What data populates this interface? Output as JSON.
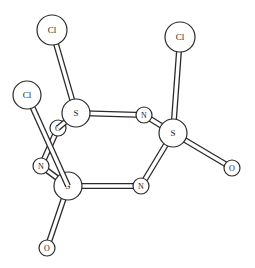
{
  "figure": {
    "type": "ball-and-stick molecular structure",
    "atoms": [
      {
        "id": "cl1",
        "label": "Cl",
        "x": 52,
        "y": 30,
        "r": 15
      },
      {
        "id": "cl2",
        "label": "Cl",
        "x": 180,
        "y": 37,
        "r": 15
      },
      {
        "id": "cl3",
        "label": "Cl",
        "x": 27,
        "y": 95,
        "r": 14
      },
      {
        "id": "o1",
        "label": "O",
        "x": 58,
        "y": 128,
        "r": 8
      },
      {
        "id": "s1",
        "label": "S",
        "x": 76,
        "y": 113,
        "r": 14
      },
      {
        "id": "n1",
        "label": "N",
        "x": 144,
        "y": 115,
        "r": 8
      },
      {
        "id": "s2",
        "label": "S",
        "x": 173,
        "y": 133,
        "r": 14
      },
      {
        "id": "n2",
        "label": "N",
        "x": 41,
        "y": 166,
        "r": 8
      },
      {
        "id": "s3",
        "label": "S",
        "x": 68,
        "y": 186,
        "r": 14
      },
      {
        "id": "n3",
        "label": "N",
        "x": 141,
        "y": 186,
        "r": 8
      },
      {
        "id": "o2",
        "label": "O",
        "x": 232,
        "y": 168,
        "r": 8
      },
      {
        "id": "o3",
        "label": "O",
        "x": 47,
        "y": 248,
        "r": 8
      }
    ],
    "bonds": [
      [
        "cl1",
        "s1"
      ],
      [
        "cl2",
        "s2"
      ],
      [
        "s1",
        "n1"
      ],
      [
        "n1",
        "s2"
      ],
      [
        "s2",
        "n3"
      ],
      [
        "n3",
        "s3"
      ],
      [
        "s3",
        "n2"
      ],
      [
        "n2",
        "o1"
      ],
      [
        "o1",
        "s1"
      ],
      [
        "s2",
        "o2"
      ],
      [
        "s3",
        "o3"
      ],
      [
        "cl3",
        "s3"
      ]
    ],
    "colors": {
      "stroke": "#2a2a2a",
      "fill": "#ffffff"
    }
  }
}
